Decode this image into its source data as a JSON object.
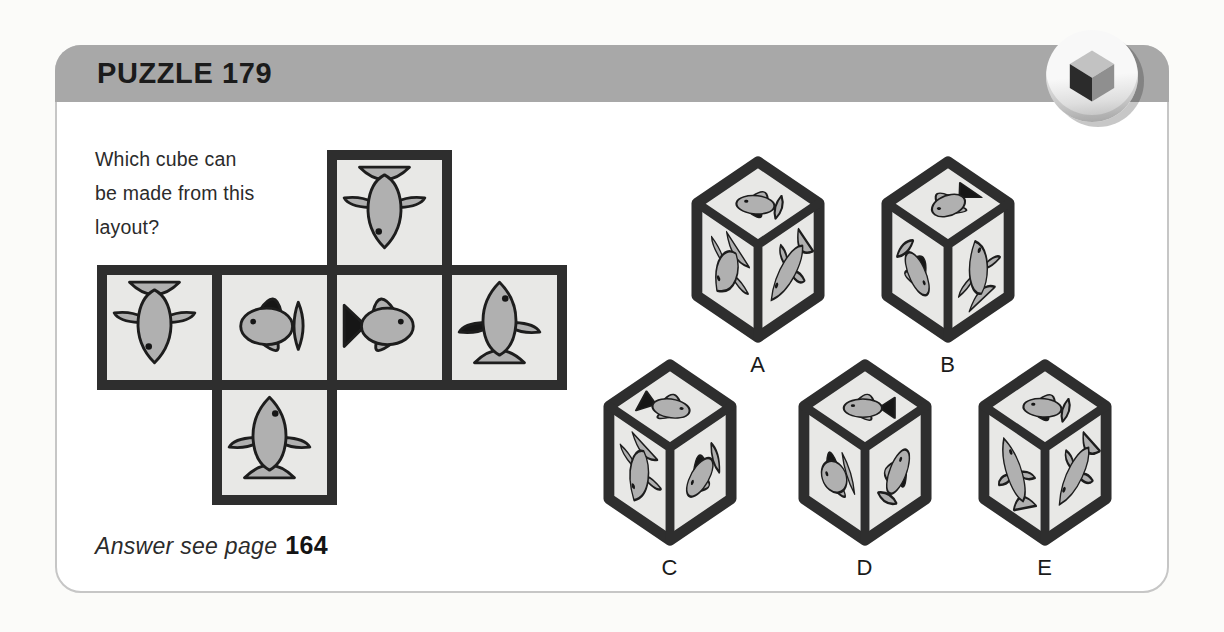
{
  "header": {
    "title": "PUZZLE 179"
  },
  "question": {
    "lines": [
      "Which cube can",
      "be made from this",
      "layout?"
    ]
  },
  "answer": {
    "prefix": "Answer see page",
    "page": "164"
  },
  "net": {
    "grid": {
      "rows": 3,
      "cols": 4,
      "cell": 115
    },
    "cells": [
      {
        "row": 0,
        "col": 2,
        "fish": {
          "type": "teardrop",
          "rotate": 180,
          "dark": []
        }
      },
      {
        "row": 1,
        "col": 0,
        "fish": {
          "type": "teardrop",
          "rotate": 180,
          "dark": []
        }
      },
      {
        "row": 1,
        "col": 1,
        "fish": {
          "type": "round",
          "facing": "left",
          "tail": "lens",
          "dark": [
            "dorsal"
          ],
          "rotate": 0
        }
      },
      {
        "row": 1,
        "col": 2,
        "fish": {
          "type": "round",
          "facing": "right",
          "tail": "solid",
          "dark": [
            "tail"
          ],
          "rotate": 0
        }
      },
      {
        "row": 1,
        "col": 3,
        "fish": {
          "type": "teardrop",
          "rotate": 0,
          "dark": [
            "left-fin"
          ]
        }
      },
      {
        "row": 2,
        "col": 1,
        "fish": {
          "type": "teardrop",
          "rotate": 0,
          "dark": []
        }
      }
    ]
  },
  "options": [
    {
      "label": "A",
      "faces": {
        "top": {
          "type": "round",
          "facing": "left",
          "tail": "lens",
          "dark": [
            "ventral"
          ],
          "rotate": -35
        },
        "left": {
          "type": "teardrop",
          "rotate": 210,
          "dark": []
        },
        "right": {
          "type": "teardrop",
          "rotate": 235,
          "dark": []
        }
      }
    },
    {
      "label": "B",
      "faces": {
        "top": {
          "type": "round",
          "facing": "left",
          "tail": "solid",
          "dark": [
            "tail"
          ],
          "rotate": -90
        },
        "left": {
          "type": "round",
          "facing": "right",
          "tail": "lens",
          "dark": [
            "dorsal"
          ],
          "rotate": 42
        },
        "right": {
          "type": "teardrop",
          "rotate": -10,
          "dark": []
        }
      }
    },
    {
      "label": "C",
      "faces": {
        "top": {
          "type": "round",
          "facing": "right",
          "tail": "solid",
          "dark": [
            "tail"
          ],
          "rotate": -25
        },
        "left": {
          "type": "teardrop",
          "rotate": 195,
          "dark": []
        },
        "right": {
          "type": "round",
          "facing": "left",
          "tail": "lens",
          "dark": [
            "dorsal"
          ],
          "rotate": -20
        }
      }
    },
    {
      "label": "D",
      "faces": {
        "top": {
          "type": "round",
          "facing": "left",
          "tail": "solid",
          "dark": [
            "tail"
          ],
          "rotate": -45
        },
        "left": {
          "type": "round",
          "facing": "left",
          "tail": "lens",
          "dark": [
            "dorsal"
          ],
          "rotate": -30
        },
        "right": {
          "type": "round",
          "facing": "right",
          "tail": "lens",
          "dark": [
            "ventral"
          ],
          "rotate": -50
        }
      }
    },
    {
      "label": "E",
      "faces": {
        "top": {
          "type": "round",
          "facing": "left",
          "tail": "lens",
          "dark": [
            "ventral"
          ],
          "rotate": -35
        },
        "left": {
          "type": "teardrop",
          "rotate": -30,
          "dark": []
        },
        "right": {
          "type": "teardrop",
          "rotate": 230,
          "dark": []
        }
      }
    }
  ],
  "colors": {
    "page_bg": "#fbfbf9",
    "card_bg": "#ffffff",
    "card_border": "#c6c6c6",
    "header_bg": "#a8a8a8",
    "title_text": "#1b1b1b",
    "body_text": "#2b2b2b",
    "dark": "#2e2e2e",
    "face_bg": "#e8e8e6",
    "fish_body": "#b0b0b0",
    "fish_dark": "#161616",
    "outline": "#1d1d1d",
    "icon_top": "#c2c2c2",
    "icon_left": "#2b2b2b",
    "icon_right": "#8f8f8f"
  }
}
